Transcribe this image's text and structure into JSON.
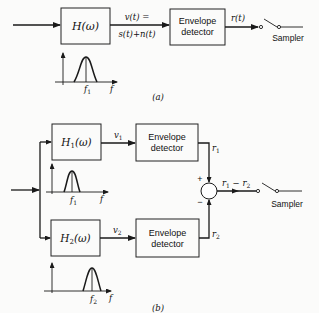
{
  "diagram_a": {
    "caption": "(a)",
    "filter": {
      "label": "H(ω)"
    },
    "signal_label_top": "v(t) =",
    "signal_label_bottom": "s(t)+n(t)",
    "detector": {
      "line1": "Envelope",
      "line2": "detector"
    },
    "output_label": "r(t)",
    "sampler_label": "Sampler",
    "spectrum": {
      "center_label": "f",
      "center_sub": "1",
      "axis_label": "f"
    }
  },
  "diagram_b": {
    "caption": "(b)",
    "branch1": {
      "filter_label": "H",
      "filter_sub": "1",
      "filter_arg": "(ω)",
      "signal_label": "v",
      "signal_sub": "1",
      "detector": {
        "line1": "Envelope",
        "line2": "detector"
      },
      "output_label": "r",
      "output_sub": "1",
      "spectrum": {
        "center_label": "f",
        "center_sub": "1",
        "axis_label": "f"
      }
    },
    "branch2": {
      "filter_label": "H",
      "filter_sub": "2",
      "filter_arg": "(ω)",
      "signal_label": "v",
      "signal_sub": "2",
      "detector": {
        "line1": "Envelope",
        "line2": "detector"
      },
      "output_label": "r",
      "output_sub": "2",
      "spectrum": {
        "center_label": "f",
        "center_sub": "2",
        "axis_label": "f"
      }
    },
    "summer": {
      "plus": "+",
      "minus": "−"
    },
    "difference_label": {
      "a": "r",
      "a_sub": "1",
      "op": " − ",
      "b": "r",
      "b_sub": "2"
    },
    "sampler_label": "Sampler"
  }
}
